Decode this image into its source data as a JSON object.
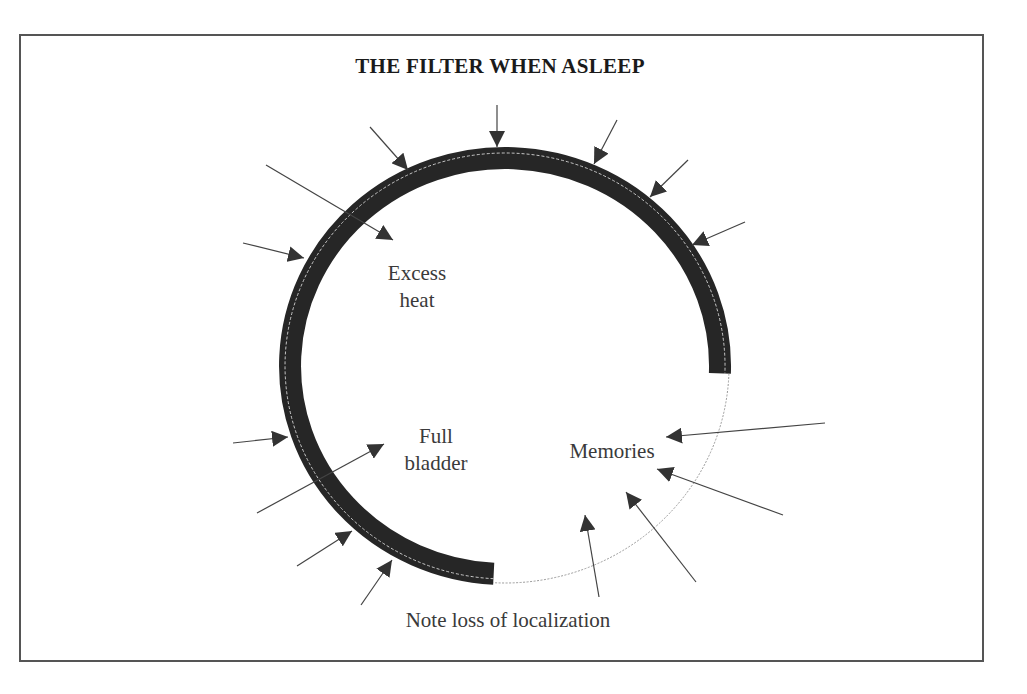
{
  "title": "THE FILTER WHEN ASLEEP",
  "colors": {
    "band": "#262626",
    "arrow": "#444444",
    "text": "#3a3a3a",
    "frame": "#555555"
  },
  "filter_ring": {
    "center": [
      505,
      366
    ],
    "radius": [
      215,
      208
    ],
    "band_width": 22,
    "solid_span": "from lower-middle (bottom) clockwise over the top to right side",
    "gap_span": "lower-right quadrant shown as thin dotted line"
  },
  "labels": {
    "excess_heat": [
      "Excess",
      "heat"
    ],
    "full_bladder": [
      "Full",
      "bladder"
    ],
    "memories": "Memories",
    "note": "Note loss of localization"
  },
  "arrows": [
    {
      "from": [
        497,
        105
      ],
      "to": [
        497,
        147
      ]
    },
    {
      "from": [
        370,
        127
      ],
      "to": [
        408,
        170
      ]
    },
    {
      "from": [
        617,
        120
      ],
      "to": [
        594,
        164
      ]
    },
    {
      "from": [
        688,
        160
      ],
      "to": [
        650,
        197
      ]
    },
    {
      "from": [
        745,
        222
      ],
      "to": [
        692,
        245
      ]
    },
    {
      "from": [
        266,
        165
      ],
      "to": [
        393,
        240
      ]
    },
    {
      "from": [
        243,
        243
      ],
      "to": [
        304,
        258
      ]
    },
    {
      "from": [
        233,
        443
      ],
      "to": [
        288,
        437
      ]
    },
    {
      "from": [
        257,
        513
      ],
      "to": [
        384,
        444
      ]
    },
    {
      "from": [
        297,
        566
      ],
      "to": [
        352,
        531
      ]
    },
    {
      "from": [
        361,
        605
      ],
      "to": [
        392,
        560
      ]
    },
    {
      "from": [
        825,
        423
      ],
      "to": [
        666,
        437
      ]
    },
    {
      "from": [
        783,
        515
      ],
      "to": [
        657,
        469
      ]
    },
    {
      "from": [
        696,
        582
      ],
      "to": [
        626,
        492
      ]
    },
    {
      "from": [
        599,
        597
      ],
      "to": [
        585,
        515
      ]
    }
  ]
}
